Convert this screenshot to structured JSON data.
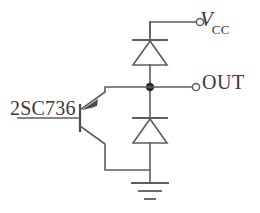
{
  "figure": {
    "kind": "schematic-diagram"
  },
  "labels": {
    "supply": {
      "symbol": "V",
      "subscript": "CC",
      "full": "VCC"
    },
    "output": "OUT",
    "transistor_part_number": "2SC736"
  },
  "terminals": [
    {
      "name": "vcc-terminal",
      "label": "VCC",
      "style": "open-circle"
    },
    {
      "name": "out-terminal",
      "label": "OUT",
      "style": "open-circle"
    }
  ],
  "components": [
    {
      "name": "diode-upper",
      "type": "diode",
      "orientation": "cathode-top"
    },
    {
      "name": "diode-lower",
      "type": "diode",
      "orientation": "cathode-top"
    },
    {
      "name": "transistor",
      "type": "bjt",
      "part": "2SC736",
      "arrow": "inward-on-upper-lead"
    },
    {
      "name": "ground",
      "type": "ground",
      "bars": 3
    }
  ],
  "nodes": [
    {
      "name": "output-junction",
      "style": "solid-dot"
    }
  ],
  "colors": {
    "wire": "#5e5e5e",
    "junction": "#2b2b2b",
    "text": "#3a3a3a",
    "background": "#ffffff"
  }
}
